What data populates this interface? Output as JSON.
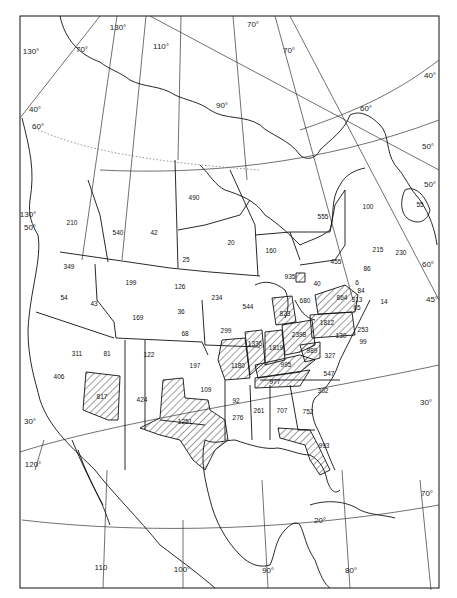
{
  "map": {
    "type": "choropleth-outline",
    "projection_hint": "conic, North America",
    "hatch_meaning_legend": "",
    "hatched_regions": [
      "817",
      "1251",
      "1336",
      "1819",
      "2398",
      "1812",
      "864",
      "823",
      "1180",
      "995",
      "977",
      "989",
      "993"
    ],
    "region_values": [
      {
        "id": "r210",
        "value": "210",
        "x": 72,
        "y": 223
      },
      {
        "id": "r540",
        "value": "540",
        "x": 118,
        "y": 233
      },
      {
        "id": "r42",
        "value": "42",
        "x": 154,
        "y": 233
      },
      {
        "id": "r490",
        "value": "490",
        "x": 194,
        "y": 198
      },
      {
        "id": "r20",
        "value": "20",
        "x": 231,
        "y": 243
      },
      {
        "id": "r160",
        "value": "160",
        "x": 271,
        "y": 251
      },
      {
        "id": "r555",
        "value": "555",
        "x": 323,
        "y": 217
      },
      {
        "id": "r100",
        "value": "100",
        "x": 368,
        "y": 207
      },
      {
        "id": "r55",
        "value": "55",
        "x": 420,
        "y": 205
      },
      {
        "id": "r215",
        "value": "215",
        "x": 378,
        "y": 250
      },
      {
        "id": "r230",
        "value": "230",
        "x": 401,
        "y": 253
      },
      {
        "id": "r455",
        "value": "455",
        "x": 336,
        "y": 262
      },
      {
        "id": "r86",
        "value": "86",
        "x": 367,
        "y": 269
      },
      {
        "id": "r25",
        "value": "25",
        "x": 186,
        "y": 260
      },
      {
        "id": "r349",
        "value": "349",
        "x": 69,
        "y": 267
      },
      {
        "id": "r199",
        "value": "199",
        "x": 131,
        "y": 283
      },
      {
        "id": "r126",
        "value": "126",
        "x": 180,
        "y": 287
      },
      {
        "id": "r234",
        "value": "234",
        "x": 217,
        "y": 298
      },
      {
        "id": "r544",
        "value": "544",
        "x": 248,
        "y": 307
      },
      {
        "id": "r935",
        "value": "935",
        "x": 290,
        "y": 277
      },
      {
        "id": "r40",
        "value": "40",
        "x": 317,
        "y": 284
      },
      {
        "id": "r6",
        "value": "6",
        "x": 357,
        "y": 283
      },
      {
        "id": "r84",
        "value": "84",
        "x": 361,
        "y": 291
      },
      {
        "id": "r864",
        "value": "864",
        "x": 342,
        "y": 298
      },
      {
        "id": "r313",
        "value": "313",
        "x": 357,
        "y": 300
      },
      {
        "id": "r14",
        "value": "14",
        "x": 384,
        "y": 302
      },
      {
        "id": "r65",
        "value": "65",
        "x": 357,
        "y": 308
      },
      {
        "id": "r680",
        "value": "680",
        "x": 305,
        "y": 301
      },
      {
        "id": "r823",
        "value": "823",
        "x": 285,
        "y": 314
      },
      {
        "id": "r54",
        "value": "54",
        "x": 64,
        "y": 298
      },
      {
        "id": "r43",
        "value": "43",
        "x": 94,
        "y": 304
      },
      {
        "id": "r169",
        "value": "169",
        "x": 138,
        "y": 318
      },
      {
        "id": "r36",
        "value": "36",
        "x": 181,
        "y": 312
      },
      {
        "id": "r68",
        "value": "68",
        "x": 185,
        "y": 334
      },
      {
        "id": "r299",
        "value": "299",
        "x": 226,
        "y": 331
      },
      {
        "id": "r1812",
        "value": "1812",
        "x": 327,
        "y": 323
      },
      {
        "id": "r253",
        "value": "253",
        "x": 363,
        "y": 330
      },
      {
        "id": "r1336",
        "value": "1336",
        "x": 255,
        "y": 344
      },
      {
        "id": "r1819",
        "value": "1819",
        "x": 276,
        "y": 348
      },
      {
        "id": "r2398",
        "value": "2398",
        "x": 299,
        "y": 335
      },
      {
        "id": "r130",
        "value": "130",
        "x": 341,
        "y": 336
      },
      {
        "id": "r99",
        "value": "99",
        "x": 363,
        "y": 342
      },
      {
        "id": "r989",
        "value": "989",
        "x": 312,
        "y": 351
      },
      {
        "id": "r327",
        "value": "327",
        "x": 330,
        "y": 356
      },
      {
        "id": "r311",
        "value": "311",
        "x": 77,
        "y": 354
      },
      {
        "id": "r81",
        "value": "81",
        "x": 107,
        "y": 354
      },
      {
        "id": "r122",
        "value": "122",
        "x": 149,
        "y": 355
      },
      {
        "id": "r197",
        "value": "197",
        "x": 195,
        "y": 366
      },
      {
        "id": "r1180",
        "value": "1180",
        "x": 238,
        "y": 366
      },
      {
        "id": "r995",
        "value": "995",
        "x": 286,
        "y": 365
      },
      {
        "id": "r547",
        "value": "547",
        "x": 329,
        "y": 374
      },
      {
        "id": "r406",
        "value": "406",
        "x": 59,
        "y": 377
      },
      {
        "id": "r977",
        "value": "977",
        "x": 275,
        "y": 382
      },
      {
        "id": "r817",
        "value": "817",
        "x": 102,
        "y": 397
      },
      {
        "id": "r424",
        "value": "424",
        "x": 142,
        "y": 400
      },
      {
        "id": "r109",
        "value": "109",
        "x": 206,
        "y": 390
      },
      {
        "id": "r302",
        "value": "302",
        "x": 323,
        "y": 391
      },
      {
        "id": "r92",
        "value": "92",
        "x": 236,
        "y": 401
      },
      {
        "id": "r1251",
        "value": "1251",
        "x": 185,
        "y": 422
      },
      {
        "id": "r276",
        "value": "276",
        "x": 238,
        "y": 418
      },
      {
        "id": "r261",
        "value": "261",
        "x": 259,
        "y": 411
      },
      {
        "id": "r707",
        "value": "707",
        "x": 282,
        "y": 411
      },
      {
        "id": "r752",
        "value": "752",
        "x": 308,
        "y": 412
      },
      {
        "id": "r993",
        "value": "993",
        "x": 324,
        "y": 446
      }
    ],
    "graticule_labels": [
      {
        "text": "130°",
        "x": 118,
        "y": 28
      },
      {
        "text": "130°",
        "x": 31,
        "y": 52
      },
      {
        "text": "70°",
        "x": 82,
        "y": 50
      },
      {
        "text": "110°",
        "x": 161,
        "y": 47
      },
      {
        "text": "70°",
        "x": 253,
        "y": 25
      },
      {
        "text": "70°",
        "x": 289,
        "y": 51
      },
      {
        "text": "90°",
        "x": 222,
        "y": 106
      },
      {
        "text": "40°",
        "x": 35,
        "y": 110
      },
      {
        "text": "60°",
        "x": 38,
        "y": 127
      },
      {
        "text": "60°",
        "x": 366,
        "y": 109
      },
      {
        "text": "40°",
        "x": 430,
        "y": 76
      },
      {
        "text": "50°",
        "x": 428,
        "y": 147
      },
      {
        "text": "50°",
        "x": 430,
        "y": 185
      },
      {
        "text": "60°",
        "x": 428,
        "y": 265
      },
      {
        "text": "45°",
        "x": 432,
        "y": 300
      },
      {
        "text": "130°",
        "x": 28,
        "y": 215
      },
      {
        "text": "50°",
        "x": 30,
        "y": 228
      },
      {
        "text": "30°",
        "x": 30,
        "y": 422
      },
      {
        "text": "30°",
        "x": 426,
        "y": 403
      },
      {
        "text": "120°",
        "x": 33,
        "y": 465
      },
      {
        "text": "70°",
        "x": 427,
        "y": 494
      },
      {
        "text": "20°",
        "x": 320,
        "y": 521
      },
      {
        "text": "110",
        "x": 101,
        "y": 568
      },
      {
        "text": "100°",
        "x": 182,
        "y": 570
      },
      {
        "text": "90°",
        "x": 268,
        "y": 571
      },
      {
        "text": "80°",
        "x": 351,
        "y": 571
      }
    ]
  }
}
